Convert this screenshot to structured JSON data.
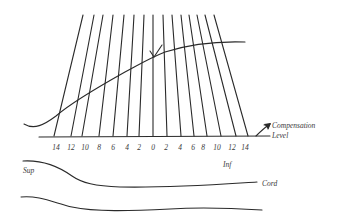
{
  "diagram": {
    "labels": {
      "compensation": "Compensation",
      "level": "Level",
      "sup": "Sup",
      "inf": "Inf",
      "cord": "Cord"
    },
    "scale_ticks": [
      "14",
      "12",
      "10",
      "8",
      "6",
      "4",
      "2",
      "0",
      "2",
      "4",
      "6",
      "8",
      "10",
      "12",
      "14"
    ],
    "colors": {
      "ink": "#2a2a2a",
      "background": "#ffffff"
    }
  }
}
